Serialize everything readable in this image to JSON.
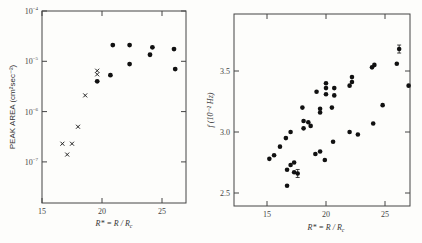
{
  "chart_data": [
    {
      "type": "scatter",
      "title": "",
      "xlabel": "R* = R / R_c",
      "ylabel": "PEAK AREA (cm² sec⁻²)",
      "xlim": [
        15,
        27
      ],
      "ylim": [
        1e-08,
        0.0001
      ],
      "yscale": "log",
      "xticks": [
        15,
        20,
        25
      ],
      "yticks": [
        "10⁻⁴",
        "10⁻⁵",
        "10⁻⁶",
        "10⁻⁷"
      ],
      "grid": false,
      "series": [
        {
          "name": "crosses",
          "marker": "x",
          "points": [
            [
              16.7,
              2.3e-07
            ],
            [
              17.1,
              1.4e-07
            ],
            [
              17.5,
              2.3e-07
            ],
            [
              18.0,
              5e-07
            ],
            [
              18.6,
              2.1e-06
            ],
            [
              19.6,
              5.5e-06
            ],
            [
              19.6,
              6.5e-06
            ]
          ]
        },
        {
          "name": "dots",
          "marker": "o",
          "points": [
            [
              19.6,
              4e-06
            ],
            [
              20.7,
              5.3e-06
            ],
            [
              20.9,
              2.1e-05
            ],
            [
              22.3,
              2.1e-05
            ],
            [
              22.3,
              8.8e-06
            ],
            [
              24.0,
              1.35e-05
            ],
            [
              24.2,
              1.9e-05
            ],
            [
              26.0,
              1.75e-05
            ],
            [
              26.1,
              7e-06
            ]
          ]
        }
      ]
    },
    {
      "type": "scatter",
      "title": "",
      "xlabel": "R* = R / R_c",
      "ylabel": "f (10⁻² Hz)",
      "xlim": [
        12,
        27
      ],
      "ylim": [
        2.4,
        3.9
      ],
      "xticks": [
        15,
        20,
        25
      ],
      "yticks": [
        2.5,
        3.0,
        3.5
      ],
      "grid": false,
      "series": [
        {
          "name": "frequency",
          "marker": "o",
          "points": [
            [
              15.2,
              2.78
            ],
            [
              15.6,
              2.81
            ],
            [
              16.1,
              2.88
            ],
            [
              16.6,
              2.95
            ],
            [
              17.0,
              3.0
            ],
            [
              16.7,
              2.69
            ],
            [
              17.0,
              2.73
            ],
            [
              17.3,
              2.75
            ],
            [
              17.3,
              2.67
            ],
            [
              17.6,
              2.66
            ],
            [
              16.7,
              2.56
            ],
            [
              18.0,
              3.2
            ],
            [
              18.1,
              3.09
            ],
            [
              18.1,
              3.03
            ],
            [
              18.5,
              3.08
            ],
            [
              18.7,
              3.05
            ],
            [
              19.2,
              3.33
            ],
            [
              19.5,
              3.16
            ],
            [
              19.5,
              3.19
            ],
            [
              20.0,
              3.4
            ],
            [
              20.0,
              3.36
            ],
            [
              20.0,
              3.31
            ],
            [
              20.5,
              3.2
            ],
            [
              20.7,
              3.36
            ],
            [
              20.7,
              3.3
            ],
            [
              19.1,
              2.82
            ],
            [
              19.5,
              2.84
            ],
            [
              19.9,
              2.77
            ],
            [
              20.6,
              2.92
            ],
            [
              22.0,
              3.38
            ],
            [
              22.2,
              3.41
            ],
            [
              22.2,
              3.45
            ],
            [
              22.0,
              3.0
            ],
            [
              22.7,
              2.98
            ],
            [
              23.9,
              3.53
            ],
            [
              24.1,
              3.55
            ],
            [
              24.0,
              3.07
            ],
            [
              24.8,
              3.22
            ],
            [
              26.0,
              3.56
            ],
            [
              26.2,
              3.68
            ],
            [
              27.0,
              3.38
            ]
          ]
        }
      ]
    }
  ],
  "left": {
    "ylabel": "PEAK AREA (cm²sec⁻²)",
    "xlabel": "R* = R / R",
    "xlabel_sub": "c",
    "yticks": [
      {
        "base": "10",
        "exp": "−4"
      },
      {
        "base": "10",
        "exp": "−5"
      },
      {
        "base": "10",
        "exp": "−6"
      },
      {
        "base": "10",
        "exp": "−7"
      }
    ],
    "xticks": [
      "15",
      "20",
      "25"
    ]
  },
  "right": {
    "ylabel": "f  (10⁻² Hz)",
    "xlabel": "R* = R / R",
    "xlabel_sub": "c",
    "yticks": [
      "3.5",
      "3.0",
      "2.5"
    ],
    "xticks": [
      "15",
      "20",
      "25"
    ]
  }
}
